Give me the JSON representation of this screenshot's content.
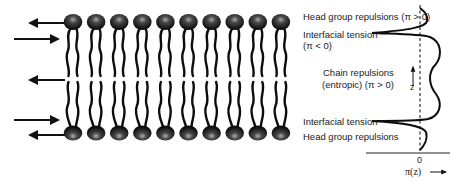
{
  "figure": {
    "lipid_count_per_leaflet": 10,
    "colors": {
      "ink": "#111111",
      "head_highlight": "#9a9a9a",
      "background": "#ffffff"
    }
  },
  "arrows": [
    {
      "id": "top-outer",
      "direction": "left",
      "y": 23
    },
    {
      "id": "top-inner",
      "direction": "right",
      "y": 39
    },
    {
      "id": "middle",
      "direction": "left",
      "y": 80
    },
    {
      "id": "bottom-inner",
      "direction": "right",
      "y": 120
    },
    {
      "id": "bottom-outer",
      "direction": "left",
      "y": 135
    }
  ],
  "labels": {
    "head_top": "Head group repulsions (π > 0)",
    "tension_top_line1": "Interfacial tension",
    "tension_top_line2": "(π < 0)",
    "chain_line1": "Chain repulsions",
    "chain_line2": "(entropic) (π > 0)",
    "z_axis": "z",
    "tension_bottom": "Interfacial tension",
    "head_bottom": "Head group repulsions",
    "zero_tick": "0",
    "x_axis": "π(z)"
  },
  "profile": {
    "zero_line_style": "dashed",
    "regions": [
      {
        "name": "Head group repulsions",
        "sign": "π > 0"
      },
      {
        "name": "Interfacial tension",
        "sign": "π < 0"
      },
      {
        "name": "Chain repulsions (entropic)",
        "sign": "π > 0"
      },
      {
        "name": "Interfacial tension",
        "sign": "π < 0"
      },
      {
        "name": "Head group repulsions",
        "sign": "π > 0"
      }
    ]
  }
}
